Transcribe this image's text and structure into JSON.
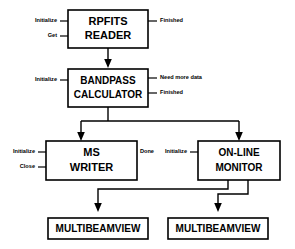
{
  "diagram": {
    "type": "flowchart",
    "title": "",
    "nodes": [
      {
        "id": "rpfits",
        "label_line1": "RPFITS",
        "label_line2": "READER"
      },
      {
        "id": "bandpass",
        "label_line1": "BANDPASS",
        "label_line2": "CALCULATOR"
      },
      {
        "id": "mswriter",
        "label_line1": "MS",
        "label_line2": "WRITER"
      },
      {
        "id": "monitor",
        "label_line1": "ON-LINE",
        "label_line2": "MONITOR"
      },
      {
        "id": "mbv_left",
        "label_line1": "MULTIBEAMVIEW",
        "label_line2": ""
      },
      {
        "id": "mbv_right",
        "label_line1": "MULTIBEAMVIEW",
        "label_line2": ""
      }
    ],
    "ports": {
      "rpfits_in_1": "Initialize",
      "rpfits_in_2": "Get",
      "rpfits_out_1": "Finished",
      "bandpass_in_1": "Initialize",
      "bandpass_out_1": "Need more data",
      "bandpass_out_2": "Finished",
      "mswriter_in_1": "Initialize",
      "mswriter_in_2": "Close",
      "mswriter_out_1": "Done",
      "monitor_in_1": "Initialize"
    },
    "colors": {
      "line": "#000000",
      "box_fill": "#ffffff",
      "background": "#ffffff"
    }
  }
}
